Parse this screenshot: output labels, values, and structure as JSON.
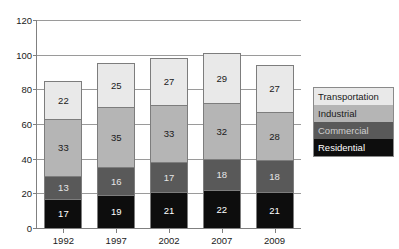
{
  "title_remnant": "",
  "chart_data": {
    "type": "bar",
    "subtype": "stacked-bar",
    "title": "",
    "xlabel": "",
    "ylabel": "",
    "ylim": [
      0,
      120
    ],
    "yticks": [
      0,
      20,
      40,
      60,
      80,
      100,
      120
    ],
    "grid": true,
    "legend_position": "right",
    "categories": [
      "1992",
      "1997",
      "2002",
      "2007",
      "2009"
    ],
    "series": [
      {
        "name": "Residential",
        "color": "#0d0d0d",
        "label_color": "#ffffff",
        "values": [
          17,
          19,
          21,
          22,
          21
        ]
      },
      {
        "name": "Commercial",
        "color": "#595959",
        "label_color": "#e6e6e6",
        "values": [
          13,
          16,
          17,
          18,
          18
        ]
      },
      {
        "name": "Industrial",
        "color": "#b5b5b5",
        "label_color": "#1a1a1a",
        "values": [
          33,
          35,
          33,
          32,
          28
        ]
      },
      {
        "name": "Transportation",
        "color": "#e9e9e9",
        "label_color": "#1a1a1a",
        "values": [
          22,
          25,
          27,
          29,
          27
        ]
      }
    ],
    "totals": [
      85,
      95,
      98,
      101,
      94
    ],
    "stack_order_top_to_bottom": [
      "Transportation",
      "Industrial",
      "Commercial",
      "Residential"
    ]
  },
  "legend": {
    "items": [
      {
        "label": "Transportation",
        "color": "#e9e9e9",
        "text_color": "#1a1a1a"
      },
      {
        "label": "Industrial",
        "color": "#b5b5b5",
        "text_color": "#1a1a1a"
      },
      {
        "label": "Commercial",
        "color": "#595959",
        "text_color": "#cfcfcf"
      },
      {
        "label": "Residential",
        "color": "#0d0d0d",
        "text_color": "#ffffff"
      }
    ]
  }
}
